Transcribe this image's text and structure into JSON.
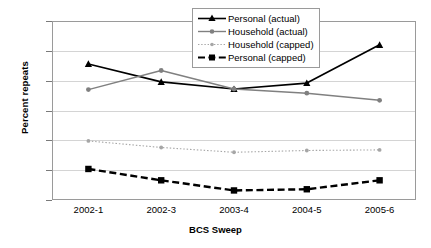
{
  "chart_data": {
    "type": "line",
    "title": "",
    "xlabel": "BCS Sweep",
    "ylabel": "Percent repeats",
    "categories": [
      "2002-1",
      "2002-3",
      "2003-4",
      "2004-5",
      "2005-6"
    ],
    "ylim": [
      30,
      60
    ],
    "yticks": [
      30,
      35,
      40,
      45,
      50,
      55,
      60
    ],
    "grid": true,
    "legend_position": "top-center",
    "series": [
      {
        "name": "Personal (actual)",
        "values": [
          52.8,
          49.8,
          48.6,
          49.6,
          56.0
        ],
        "color": "#000000",
        "marker": "triangle",
        "linestyle": "solid"
      },
      {
        "name": "Household (actual)",
        "values": [
          48.5,
          51.7,
          48.6,
          47.9,
          46.7
        ],
        "color": "#808080",
        "marker": "circle",
        "linestyle": "solid"
      },
      {
        "name": "Household (capped)",
        "values": [
          39.9,
          38.8,
          38.0,
          38.3,
          38.4
        ],
        "color": "#a6a6a6",
        "marker": "circle-small",
        "linestyle": "dotted"
      },
      {
        "name": "Personal (capped)",
        "values": [
          35.2,
          33.3,
          31.6,
          31.8,
          33.3
        ],
        "color": "#000000",
        "marker": "square",
        "linestyle": "dashed"
      }
    ]
  },
  "axes": {
    "y_title": "Percent repeats",
    "x_title": "BCS Sweep",
    "y_tick_labels": [
      "60",
      "55",
      "50",
      "45",
      "40",
      "35",
      "30"
    ],
    "x_tick_labels": [
      "2002-1",
      "2002-3",
      "2003-4",
      "2004-5",
      "2005-6"
    ]
  },
  "legend": {
    "entries": [
      {
        "label": "Personal (actual)"
      },
      {
        "label": "Household (actual)"
      },
      {
        "label": "Household (capped)"
      },
      {
        "label": "Personal (capped)"
      }
    ]
  }
}
